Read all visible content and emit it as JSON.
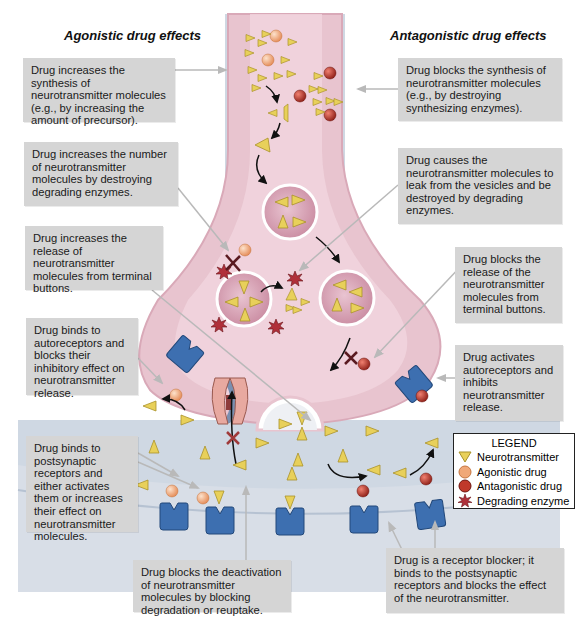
{
  "headings": {
    "agonistic": "Agonistic drug effects",
    "antagonistic": "Antagonistic drug effects"
  },
  "agonistic_boxes": [
    {
      "id": "synthesis",
      "text": "Drug increases the synthesis of neurotransmitter molecules (e.g., by increasing the amount of precursor)."
    },
    {
      "id": "degrading",
      "text": "Drug increases the number of neurotransmitter molecules by destroying degrading enzymes."
    },
    {
      "id": "release",
      "text": "Drug increases the release of neurotransmitter molecules from terminal buttons."
    },
    {
      "id": "autoreceptors",
      "text": "Drug binds to autoreceptors and blocks their inhibitory effect on neurotransmitter release."
    },
    {
      "id": "postsynaptic",
      "text": "Drug binds to postsynaptic receptors and either activates them or increases their effect on neurotransmitter molecules."
    },
    {
      "id": "deactivation",
      "text": "Drug blocks the deactivation of neurotransmitter molecules by blocking degradation or reuptake."
    }
  ],
  "antagonistic_boxes": [
    {
      "id": "synthesis",
      "text": "Drug blocks the synthesis of neurotransmitter molecules (e.g., by destroying synthesizing enzymes)."
    },
    {
      "id": "leak",
      "text": "Drug causes the neurotransmitter molecules to leak from the vesicles and be destroyed by degrading enzymes."
    },
    {
      "id": "release",
      "text": "Drug blocks the release of the neurotransmitter molecules from terminal buttons."
    },
    {
      "id": "autoreceptors",
      "text": "Drug activates autoreceptors and inhibits neurotransmitter release."
    },
    {
      "id": "blocker",
      "text": "Drug is a receptor blocker; it binds to the postsynaptic receptors and blocks the effect of the neurotransmitter."
    }
  ],
  "legend": {
    "title": "LEGEND",
    "items": [
      {
        "icon": "neurotransmitter-triangle",
        "label": "Neurotransmitter"
      },
      {
        "icon": "agonistic-drug-circle",
        "label": "Agonistic drug"
      },
      {
        "icon": "antagonistic-drug-circle",
        "label": "Antagonistic drug"
      },
      {
        "icon": "degrading-enzyme-star",
        "label": "Degrading enzyme"
      }
    ]
  },
  "colors": {
    "background_panel": "#c9d3df",
    "neuron_terminal": "#e8c4cf",
    "neuron_terminal_edge": "#d9a9b8",
    "postsynaptic": "#e2e6ec",
    "neurotransmitter": "#e8d05a",
    "agonist": "#f0a878",
    "antagonist": "#c0392b",
    "receptor": "#3d6fb0",
    "enzyme": "#b0303a",
    "vesicle": "#dcb0c0",
    "box": "#d5d5d5"
  }
}
